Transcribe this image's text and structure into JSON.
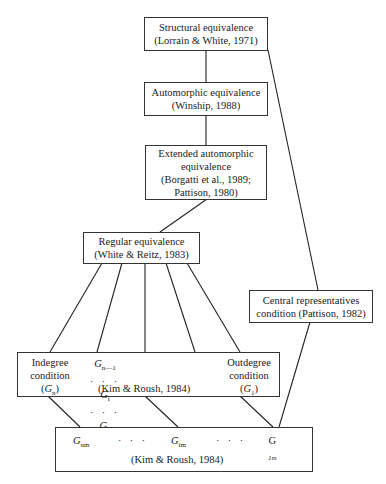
{
  "diagram": {
    "nodes": {
      "structural": {
        "label": "Structural equivalence",
        "cite": "(Lorrain & White, 1971)"
      },
      "automorphic": {
        "label": "Automorphic equivalence",
        "cite": "(Winship, 1988)"
      },
      "extended": {
        "label1": "Extended automorphic",
        "label2": "equivalence",
        "cite1": "(Borgatti et al., 1989;",
        "cite2": "Pattison, 1980)"
      },
      "regular": {
        "label": "Regular equivalence",
        "cite": "(White & Reitz, 1983)"
      },
      "central": {
        "label1": "Central representatives",
        "label2": "condition (Pattison, 1982)"
      },
      "conditions": {
        "indegree": {
          "l1": "Indegree",
          "l2": "condition",
          "sym": "G",
          "sub": "n"
        },
        "outdegree": {
          "l1": "Outdegree",
          "l2": "condition",
          "sym": "G",
          "sub": "1"
        },
        "g_n1": {
          "sym": "G",
          "sub": "n—1"
        },
        "g_i": {
          "sym": "G",
          "sub": "i"
        },
        "g_2": {
          "sym": "G",
          "sub": "2"
        },
        "dots": "· · ·",
        "cite": "(Kim & Roush, 1984)"
      },
      "bottom": {
        "g_nm": {
          "sym": "G",
          "sub": "nm"
        },
        "g_im": {
          "sym": "G",
          "sub": "im"
        },
        "g_1m": {
          "sym": "G",
          "sub": "1m"
        },
        "dots": "· · ·",
        "cite": "(Kim & Roush, 1984)"
      }
    }
  }
}
